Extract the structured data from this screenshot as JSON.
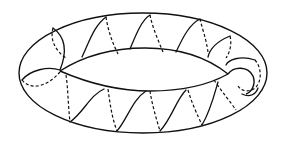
{
  "figure": {
    "colors": {
      "background": "#ffffff",
      "stroke": "#111111"
    },
    "torus": {
      "outer_ellipse": {
        "cx": 143,
        "cy": 73,
        "rx": 124,
        "ry": 60
      },
      "inner_hole": {
        "left": [
          60,
          70
        ],
        "right": [
          228,
          74
        ],
        "top_y": 48,
        "bottom_y": 92
      }
    },
    "helix": {
      "front_segment_style": "solid",
      "back_segment_style": "dashed",
      "approx_windings": 12
    }
  }
}
